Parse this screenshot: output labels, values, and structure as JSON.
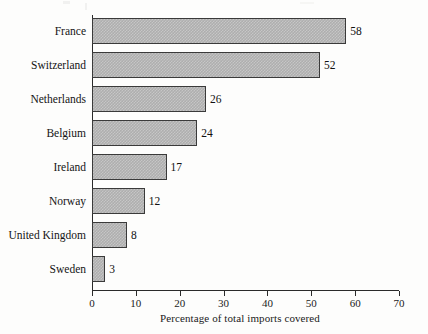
{
  "chart_data": {
    "type": "bar",
    "orientation": "horizontal",
    "title": "",
    "subtitle": "",
    "xlabel": "Percentage of total imports covered",
    "ylabel": "",
    "categories": [
      "France",
      "Switzerland",
      "Netherlands",
      "Belgium",
      "Ireland",
      "Norway",
      "United Kingdom",
      "Sweden"
    ],
    "values": [
      58,
      52,
      26,
      24,
      17,
      12,
      8,
      3
    ],
    "value_labels": [
      "58",
      "52",
      "26",
      "24",
      "17",
      "12",
      "8",
      "3"
    ],
    "xlim": [
      0,
      70
    ],
    "xticks": [
      0,
      10,
      20,
      30,
      40,
      50,
      60,
      70
    ],
    "xtick_labels": [
      "0",
      "10",
      "20",
      "30",
      "40",
      "50",
      "60",
      "70"
    ],
    "grid": false,
    "legend": null,
    "bar_fill_color": "#b2b2b2",
    "bar_edge_color": "#3a3a3a",
    "axis_color": "#2a2a2a",
    "text_color": "#1b1b1b",
    "background_color": "#fdfdfc"
  }
}
